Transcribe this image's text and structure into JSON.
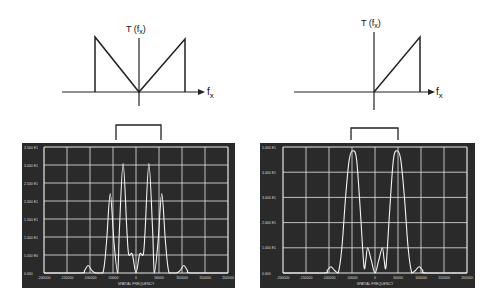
{
  "figures": [
    {
      "id": "left",
      "transfer_function": {
        "ylabel": "T (f",
        "ylabel_sub": "x",
        "ylabel_close": ")",
        "xlabel": "f",
        "xlabel_sub": "x",
        "shape": "symmetric V-ramp (|f_x| ramp, truncated)"
      },
      "aperture_symbol": "rect"
    },
    {
      "id": "right",
      "transfer_function": {
        "ylabel": "T (f",
        "ylabel_sub": "x",
        "ylabel_close": ")",
        "xlabel": "f",
        "xlabel_sub": "x",
        "shape": "one-sided ramp (f_x >= 0, truncated)"
      },
      "aperture_symbol": "rect"
    }
  ],
  "chart_data": [
    {
      "type": "line",
      "title": "",
      "xlabel": "SPATIAL FREQUENCY",
      "ylabel": "",
      "x_ticks": [
        "-200000",
        "-150000",
        "-100000",
        "-50000",
        "0",
        "50000",
        "100000",
        "150000",
        "200000"
      ],
      "y_ticks": [
        "0.000",
        "5.000 E0",
        "1.000 E1",
        "1.500 E1",
        "2.000 E1",
        "2.500 E1",
        "3.000 E1",
        "3.500 E1"
      ],
      "grid": true,
      "xlim": [
        -200000,
        200000
      ],
      "ylim": [
        0,
        35
      ],
      "series": [
        {
          "name": "intensity",
          "x_norm": [
            0.0,
            0.2,
            0.22,
            0.24,
            0.26,
            0.28,
            0.32,
            0.34,
            0.36,
            0.38,
            0.4,
            0.41,
            0.43,
            0.45,
            0.46,
            0.48,
            0.5,
            0.52,
            0.54,
            0.55,
            0.57,
            0.59,
            0.6,
            0.62,
            0.64,
            0.66,
            0.68,
            0.72,
            0.74,
            0.76,
            0.78,
            0.8,
            1.0
          ],
          "y_norm": [
            0.0,
            0.0,
            0.02,
            0.06,
            0.02,
            0.0,
            0.0,
            0.25,
            0.63,
            0.25,
            0.0,
            0.35,
            0.87,
            0.35,
            0.15,
            0.15,
            0.0,
            0.15,
            0.15,
            0.35,
            0.87,
            0.35,
            0.0,
            0.25,
            0.63,
            0.25,
            0.0,
            0.0,
            0.02,
            0.06,
            0.02,
            0.0,
            0.0
          ]
        }
      ]
    },
    {
      "type": "line",
      "title": "",
      "xlabel": "SPATIAL FREQUENCY",
      "ylabel": "",
      "x_ticks": [
        "-200000",
        "-150000",
        "-100000",
        "-50000",
        "0",
        "50000",
        "100000",
        "150000",
        "200000"
      ],
      "y_ticks": [
        "0.000",
        "1.000 E1",
        "2.000 E1",
        "3.000 E1",
        "4.000 E1",
        "5.000 E1"
      ],
      "grid": true,
      "xlim": [
        -200000,
        200000
      ],
      "ylim": [
        0,
        50
      ],
      "series": [
        {
          "name": "intensity",
          "x_norm": [
            0.0,
            0.22,
            0.24,
            0.26,
            0.28,
            0.3,
            0.32,
            0.34,
            0.36,
            0.38,
            0.4,
            0.42,
            0.44,
            0.45,
            0.46,
            0.48,
            0.5,
            0.52,
            0.54,
            0.55,
            0.56,
            0.58,
            0.6,
            0.62,
            0.64,
            0.66,
            0.68,
            0.7,
            0.72,
            0.74,
            0.76,
            0.78,
            1.0
          ],
          "y_norm": [
            0.0,
            0.0,
            0.02,
            0.05,
            0.02,
            0.0,
            0.2,
            0.6,
            0.9,
            0.97,
            0.9,
            0.5,
            0.05,
            0.1,
            0.2,
            0.1,
            0.0,
            0.1,
            0.2,
            0.1,
            0.05,
            0.5,
            0.9,
            0.97,
            0.9,
            0.6,
            0.2,
            0.0,
            0.02,
            0.05,
            0.02,
            0.0,
            0.0
          ]
        }
      ]
    }
  ]
}
